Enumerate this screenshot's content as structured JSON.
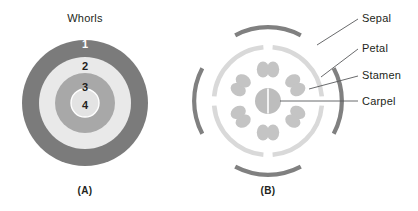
{
  "figure": {
    "panel_a": {
      "title": "Whorls",
      "caption": "(A)",
      "ring_labels": [
        "1",
        "2",
        "3",
        "4"
      ],
      "ring_colors": [
        "#7b7b7b",
        "#e9e9e9",
        "#a8a8a8",
        "#e3e3e3"
      ],
      "center": {
        "x": 85,
        "y": 103
      },
      "radii": [
        63,
        46,
        30,
        14
      ]
    },
    "panel_b": {
      "caption": "(B)",
      "center": {
        "x": 268,
        "y": 101
      },
      "sepal_ring": {
        "radius": 70,
        "color": "#808080",
        "arc_count": 4
      },
      "petal_ring": {
        "radius": 54,
        "color": "#d9d9d9",
        "arc_count": 4
      },
      "stamen": {
        "count": 6,
        "color": "#c4c4c4",
        "orbit_radius": 32
      },
      "carpel": {
        "color": "#bdbdbd",
        "radius": 13
      },
      "labels": [
        {
          "name": "sepal",
          "text": "Sepal"
        },
        {
          "name": "petal",
          "text": "Petal"
        },
        {
          "name": "stamen",
          "text": "Stamen"
        },
        {
          "name": "carpel",
          "text": "Carpel"
        }
      ]
    }
  },
  "colors": {
    "text": "#231f20",
    "leader_line": "#58595b",
    "whorl_1": "#7b7b7b",
    "whorl_2": "#e9e9e9",
    "whorl_3": "#a8a8a8",
    "whorl_4": "#e3e3e3",
    "sepal": "#808080",
    "petal": "#d9d9d9",
    "stamen": "#c4c4c4",
    "carpel": "#bdbdbd"
  }
}
